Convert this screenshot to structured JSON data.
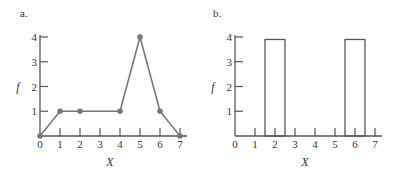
{
  "chart_data": [
    {
      "panel": "a.",
      "type": "line",
      "title": "",
      "xlabel": "X",
      "ylabel": "f",
      "x": [
        0,
        1,
        2,
        4,
        5,
        6,
        7
      ],
      "y": [
        0,
        1,
        1,
        1,
        4,
        1,
        0
      ],
      "xticks": [
        "0",
        "1",
        "2",
        "3",
        "4",
        "5",
        "6",
        "7"
      ],
      "yticks": [
        "1",
        "2",
        "3",
        "4"
      ],
      "xlim": [
        0,
        7
      ],
      "ylim": [
        0,
        4
      ],
      "markers": true,
      "grid": false
    },
    {
      "panel": "b.",
      "type": "bar",
      "title": "",
      "xlabel": "X",
      "ylabel": "f",
      "bars": [
        {
          "x_start": 1.5,
          "x_end": 2.5,
          "value": 3.9
        },
        {
          "x_start": 5.5,
          "x_end": 6.5,
          "value": 3.9
        }
      ],
      "xticks": [
        "0",
        "1",
        "2",
        "3",
        "4",
        "5",
        "6",
        "7"
      ],
      "yticks": [
        "1",
        "2",
        "3",
        "4"
      ],
      "xlim": [
        0,
        7
      ],
      "ylim": [
        0,
        4
      ],
      "grid": false
    }
  ]
}
